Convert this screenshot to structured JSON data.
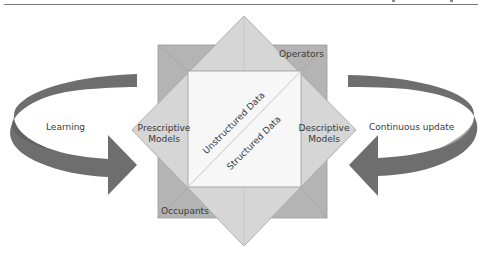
{
  "diagram": {
    "title": "",
    "colors": {
      "back_square": "#b4b4b4",
      "back_square_edge": "#9a9a9a",
      "diamond": "#d6d6d6",
      "diamond_edge": "#a8a8a8",
      "inner_square": "#f7f7f7",
      "inner_edge": "#a0a0a0",
      "arrow": "#6e6e6e",
      "arrow_dark": "#5a5a5a",
      "text": "#3a3a3a"
    },
    "back_square": {
      "top_right_label": "Operators",
      "bottom_left_label": "Occupants"
    },
    "diamond": {
      "left_label_line1": "Prescriptive",
      "left_label_line2": "Models",
      "right_label_line1": "Descriptive",
      "right_label_line2": "Models"
    },
    "inner_square": {
      "upper_label": "Unstructured Data",
      "lower_label": "Structured Data"
    },
    "left_arrow": {
      "label": "Learning",
      "direction": "clockwise-into-center"
    },
    "right_arrow": {
      "label": "Continuous update",
      "direction": "counterclockwise-into-center"
    }
  }
}
